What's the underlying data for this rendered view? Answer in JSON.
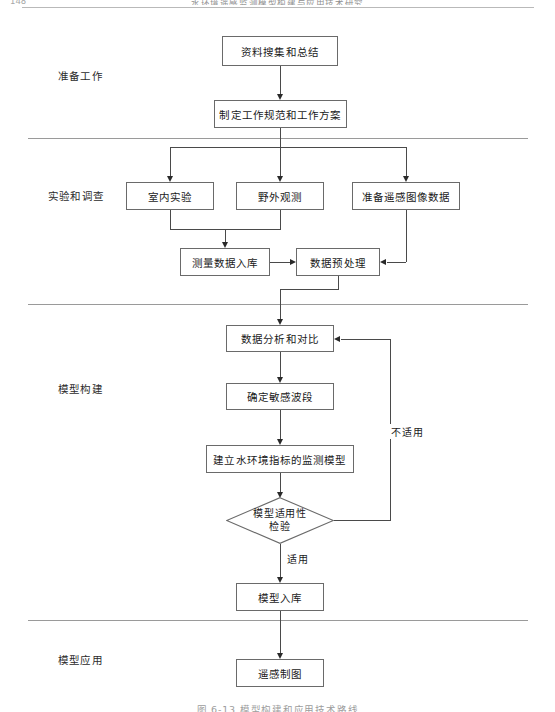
{
  "page": {
    "folio": "148",
    "running_head": "水环境遥感监测模型构建与应用技术研究",
    "caption": "图 6-13  模型构建和应用技术路线"
  },
  "sections": [
    {
      "id": "preparation",
      "label": "准备工作"
    },
    {
      "id": "experiment",
      "label": "实验和调查"
    },
    {
      "id": "modeling",
      "label": "模型构建"
    },
    {
      "id": "application",
      "label": "模型应用"
    }
  ],
  "nodes": [
    {
      "id": "data-collection",
      "label": "资料搜集和总结",
      "shape": "process"
    },
    {
      "id": "work-plan",
      "label": "制定工作规范和工作方案",
      "shape": "process"
    },
    {
      "id": "indoor-experiment",
      "label": "室内实验",
      "shape": "process"
    },
    {
      "id": "field-observation",
      "label": "野外观测",
      "shape": "process"
    },
    {
      "id": "prepare-rs-image",
      "label": "准备遥感图像数据",
      "shape": "process"
    },
    {
      "id": "measure-db",
      "label": "测量数据入库",
      "shape": "process"
    },
    {
      "id": "preprocess",
      "label": "数据预处理",
      "shape": "process"
    },
    {
      "id": "analysis-compare",
      "label": "数据分析和对比",
      "shape": "process"
    },
    {
      "id": "sensitive-band",
      "label": "确定敏感波段",
      "shape": "process"
    },
    {
      "id": "build-model",
      "label": "建立水环境指标的监测模型",
      "shape": "process"
    },
    {
      "id": "applicability",
      "label_line1": "模型适用性",
      "label_line2": "检验",
      "shape": "decision"
    },
    {
      "id": "model-db",
      "label": "模型入库",
      "shape": "process"
    },
    {
      "id": "rs-mapping",
      "label": "遥感制图",
      "shape": "process"
    }
  ],
  "edge_labels": [
    {
      "id": "not-applicable",
      "label": "不适用"
    },
    {
      "id": "applicable",
      "label": "适用"
    }
  ],
  "colors": {
    "box_border": "#6a6a6a",
    "connector": "#4a4a4a",
    "divider": "#9a9a9a",
    "text": "#1a1a1a",
    "background": "#ffffff"
  }
}
